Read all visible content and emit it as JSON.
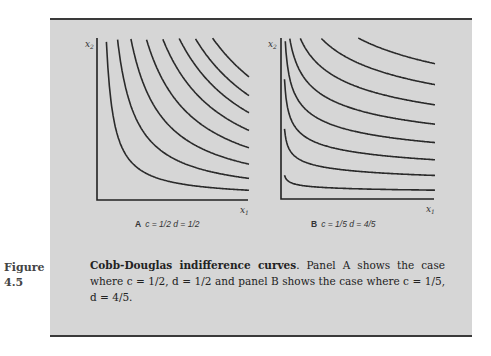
{
  "figure": {
    "number_label": "Figure",
    "number_value": "4.5",
    "caption_title": "Cobb-Douglas indifference curves",
    "caption_text": ". Panel A shows the case where c = 1/2, d = 1/2 and panel B shows the case where c = 1/5, d = 4/5."
  },
  "panels": [
    {
      "letter": "A",
      "label_text": "c = 1/2 d = 1/2",
      "x_axis_label": "x",
      "x_axis_sub": "1",
      "y_axis_label": "x",
      "y_axis_sub": "2"
    },
    {
      "letter": "B",
      "label_text": "c = 1/5 d = 4/5",
      "x_axis_label": "x",
      "x_axis_sub": "1",
      "y_axis_label": "x",
      "y_axis_sub": "2"
    }
  ],
  "chart_data": [
    {
      "type": "line",
      "title": "A  c = 1/2 d = 1/2",
      "xlabel": "x1",
      "ylabel": "x2",
      "function": "x1^c * x2^d = k",
      "c": 0.5,
      "d": 0.5,
      "levels": [
        0.22,
        0.35,
        0.46,
        0.56,
        0.65,
        0.73,
        0.8,
        0.87
      ],
      "xlim": [
        0,
        1
      ],
      "ylim": [
        0,
        1
      ],
      "grid": false,
      "ticks": false,
      "num_curves": 8
    },
    {
      "type": "line",
      "title": "B  c = 1/5 d = 4/5",
      "xlabel": "x1",
      "ylabel": "x2",
      "function": "x1^c * x2^d = k",
      "c": 0.2,
      "d": 0.8,
      "levels": [
        0.08,
        0.2,
        0.31,
        0.42,
        0.53,
        0.64,
        0.75,
        0.86
      ],
      "xlim": [
        0,
        1
      ],
      "ylim": [
        0,
        1
      ],
      "grid": false,
      "ticks": false,
      "num_curves": 8
    }
  ]
}
